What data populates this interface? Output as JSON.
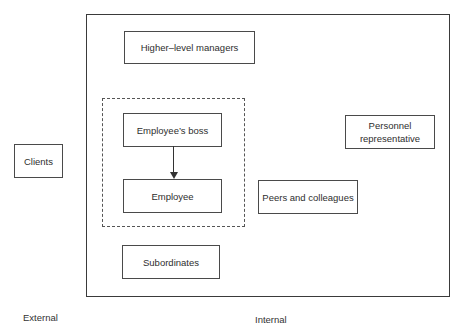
{
  "diagram": {
    "nodes": {
      "higher_level_managers": "Higher–level managers",
      "employees_boss": "Employee’s boss",
      "employee": "Employee",
      "subordinates": "Subordinates",
      "peers_and_colleagues": "Peers and colleagues",
      "personnel_representative": "Personnel representative",
      "clients": "Clients"
    },
    "region_labels": {
      "external": "External",
      "internal": "Internal"
    },
    "edges": [
      {
        "from": "employees_boss",
        "to": "employee",
        "type": "arrow"
      }
    ],
    "groups": [
      {
        "name": "dashed-group",
        "members": [
          "employees_boss",
          "employee"
        ],
        "style": "dashed"
      }
    ]
  }
}
